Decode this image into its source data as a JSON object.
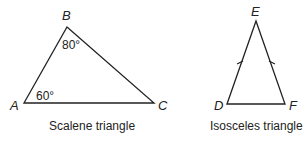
{
  "scalene": {
    "vertices": {
      "A": "A",
      "B": "B",
      "C": "C"
    },
    "angles": {
      "A": "60°",
      "B": "80°"
    },
    "caption": "Scalene triangle"
  },
  "isosceles": {
    "vertices": {
      "D": "D",
      "E": "E",
      "F": "F"
    },
    "caption": "Isosceles triangle"
  },
  "colors": {
    "stroke": "#222222",
    "background": "#ffffff"
  }
}
